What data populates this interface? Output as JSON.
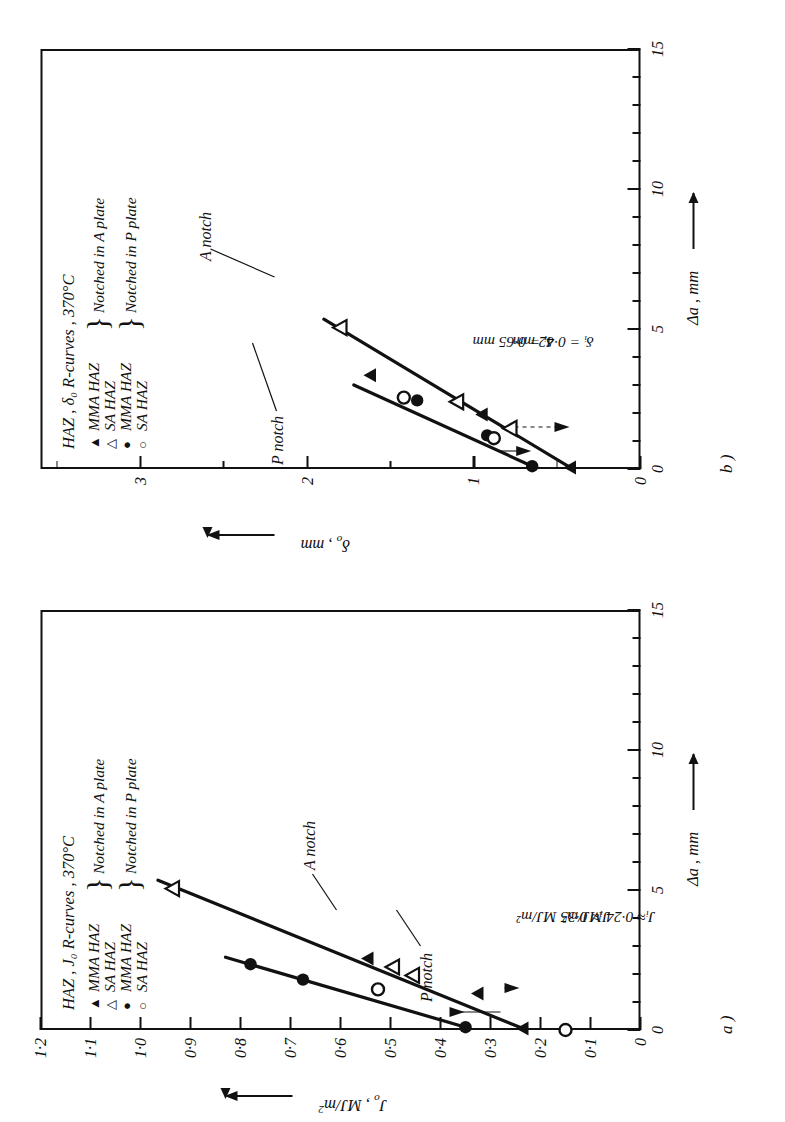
{
  "figure": {
    "panel_a_label": "a )",
    "panel_b_label": "b )"
  },
  "panel_a": {
    "legend": {
      "title": "HAZ , J₀ R-curves , 370°C",
      "entries": [
        {
          "symbol": "filled-triangle",
          "glyph": "▲",
          "label": "MMA HAZ"
        },
        {
          "symbol": "open-triangle",
          "glyph": "△",
          "label": "SA  HAZ"
        },
        {
          "symbol": "filled-circle",
          "glyph": "●",
          "label": "MMA HAZ"
        },
        {
          "symbol": "open-circle",
          "glyph": "○",
          "label": "SA HAZ"
        }
      ],
      "group_labels": [
        "Notched in A plate",
        "Notched in P plate"
      ]
    },
    "curve_labels": [
      "A notch",
      "P notch"
    ],
    "annotations": [
      "Jᵢ≈ 0·35 MJ/m²",
      "Jᵢ≈ 0·24 MJ/m²"
    ],
    "chart_data": {
      "type": "scatter",
      "title": "HAZ , J₀ R-curves , 370°C",
      "xlabel": "Δa , mm",
      "ylabel": "J₀ , MJ/m²",
      "xlim": [
        0,
        15
      ],
      "ylim": [
        0,
        1.2
      ],
      "xticks": [
        0,
        5,
        10,
        15
      ],
      "xticklabels": [
        "0",
        "5",
        "10",
        "15"
      ],
      "xminor_step": 1,
      "yticks": [
        0,
        0.1,
        0.2,
        0.3,
        0.4,
        0.5,
        0.6,
        0.7,
        0.8,
        0.9,
        1.0,
        1.1,
        1.2
      ],
      "yticklabels": [
        "0",
        "0·1",
        "0·2",
        "0·3",
        "0·4",
        "0·5",
        "0·6",
        "0·7",
        "0·8",
        "0·9",
        "1·0",
        "1·1",
        "1·2"
      ],
      "grid": false,
      "legend_position": "top-left-inside",
      "series": [
        {
          "name": "MMA HAZ – Notched in A plate",
          "marker": "filled-triangle",
          "points": [
            [
              0.05,
              0.235
            ],
            [
              1.3,
              0.325
            ],
            [
              2.55,
              0.545
            ]
          ]
        },
        {
          "name": "SA HAZ – Notched in A plate",
          "marker": "open-triangle",
          "points": [
            [
              1.95,
              0.455
            ],
            [
              2.25,
              0.495
            ],
            [
              5.05,
              0.935
            ]
          ]
        },
        {
          "name": "MMA HAZ – Notched in P plate",
          "marker": "filled-circle",
          "points": [
            [
              0.1,
              0.35
            ],
            [
              1.8,
              0.675
            ],
            [
              2.35,
              0.78
            ]
          ]
        },
        {
          "name": "SA HAZ – Notched in P plate",
          "marker": "open-circle",
          "points": [
            [
              0.0,
              0.15
            ],
            [
              1.45,
              0.525
            ]
          ]
        }
      ],
      "fit_lines": [
        {
          "name": "A notch",
          "from": [
            0.05,
            0.235
          ],
          "to": [
            5.35,
            0.965
          ]
        },
        {
          "name": "P notch",
          "from": [
            0.1,
            0.35
          ],
          "to": [
            2.6,
            0.83
          ]
        }
      ],
      "initiation_markers": [
        {
          "label": "Jᵢ≈ 0·35 MJ/m²",
          "value": 0.35,
          "style": "solid"
        },
        {
          "label": "Jᵢ≈ 0·24 MJ/m²",
          "value": 0.24,
          "style": "dashed"
        }
      ]
    }
  },
  "panel_b": {
    "legend": {
      "title": "HAZ , δ₀ R-curves , 370°C",
      "entries": [
        {
          "symbol": "filled-triangle",
          "glyph": "▲",
          "label": "MMA HAZ"
        },
        {
          "symbol": "open-triangle",
          "glyph": "△",
          "label": "SA  HAZ"
        },
        {
          "symbol": "filled-circle",
          "glyph": "●",
          "label": "MMA HAZ"
        },
        {
          "symbol": "open-circle",
          "glyph": "○",
          "label": "SA HAZ"
        }
      ],
      "group_labels": [
        "Notched in A plate",
        "Notched in P plate"
      ]
    },
    "curve_labels": [
      "A notch",
      "P notch"
    ],
    "annotations": [
      "δᵢ = 0·65 mm",
      "δᵢ = 0·42 mm"
    ],
    "chart_data": {
      "type": "scatter",
      "title": "HAZ , δ₀ R-curves , 370°C",
      "xlabel": "Δa , mm",
      "ylabel": "δ₀ , mm",
      "xlim": [
        0,
        15
      ],
      "ylim": [
        0,
        3.6
      ],
      "xticks": [
        0,
        5,
        10,
        15
      ],
      "xticklabels": [
        "0",
        "5",
        "10",
        "15"
      ],
      "xminor_step": 1,
      "yticks": [
        0,
        1,
        2,
        3
      ],
      "yticklabels": [
        "0",
        "1",
        "2",
        "3"
      ],
      "yminor_step": 0.5,
      "grid": false,
      "legend_position": "top-left-inside",
      "series": [
        {
          "name": "MMA HAZ – Notched in A plate",
          "marker": "filled-triangle",
          "points": [
            [
              0.05,
              0.42
            ],
            [
              1.95,
              0.95
            ],
            [
              3.35,
              1.62
            ]
          ]
        },
        {
          "name": "SA HAZ – Notched in A plate",
          "marker": "open-triangle",
          "points": [
            [
              1.45,
              0.78
            ],
            [
              2.4,
              1.1
            ],
            [
              5.05,
              1.8
            ]
          ]
        },
        {
          "name": "MMA HAZ – Notched in P plate",
          "marker": "filled-circle",
          "points": [
            [
              0.1,
              0.65
            ],
            [
              1.2,
              0.92
            ],
            [
              2.45,
              1.34
            ]
          ]
        },
        {
          "name": "SA HAZ – Notched in P plate",
          "marker": "open-circle",
          "points": [
            [
              1.1,
              0.88
            ],
            [
              2.55,
              1.42
            ]
          ]
        }
      ],
      "fit_lines": [
        {
          "name": "A notch",
          "from": [
            0.05,
            0.42
          ],
          "to": [
            5.35,
            1.9
          ]
        },
        {
          "name": "P notch",
          "from": [
            0.1,
            0.65
          ],
          "to": [
            3.0,
            1.72
          ]
        }
      ],
      "initiation_markers": [
        {
          "label": "δᵢ = 0·65 mm",
          "value": 0.65,
          "style": "solid"
        },
        {
          "label": "δᵢ = 0·42 mm",
          "value": 0.42,
          "style": "dashed"
        }
      ]
    }
  }
}
